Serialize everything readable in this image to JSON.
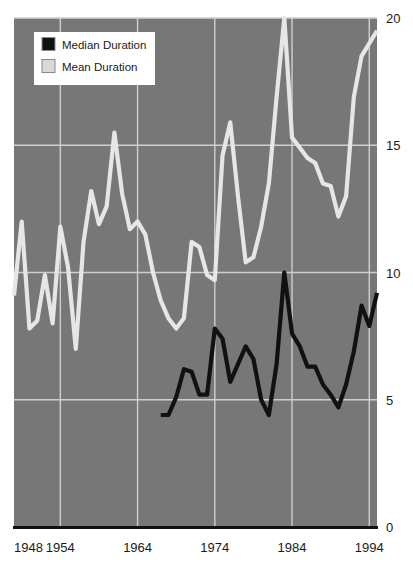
{
  "chart_data": {
    "type": "line",
    "title": "",
    "subtitle": "",
    "xlabel": "",
    "ylabel": "",
    "xlim": [
      1948,
      1995
    ],
    "ylim": [
      0,
      20
    ],
    "grid": true,
    "x_ticks": [
      "1948",
      "1954",
      "1964",
      "1974",
      "1984",
      "1994"
    ],
    "x_tick_values": [
      1948,
      1954,
      1964,
      1974,
      1984,
      1994
    ],
    "y_ticks": [
      "0",
      "5",
      "10",
      "15",
      "20"
    ],
    "y_tick_values": [
      0,
      5,
      10,
      15,
      20
    ],
    "legend": {
      "position": "top-left",
      "entries": [
        {
          "label": "Median Duration",
          "color": "#111111",
          "swatch": "black-square"
        },
        {
          "label": "Mean Duration",
          "color": "#d9d9d9",
          "swatch": "light-gray-square"
        }
      ]
    },
    "colors": {
      "plot_background": "#777777",
      "gridline": "#cfcfcf",
      "axis": "#111111",
      "mean_line": "#e6e6e6",
      "median_line": "#111111",
      "page_background": "#ffffff",
      "text": "#1a1a1a"
    },
    "series": [
      {
        "name": "Mean Duration",
        "color": "#e6e6e6",
        "x": [
          1948,
          1949,
          1950,
          1951,
          1952,
          1953,
          1954,
          1955,
          1956,
          1957,
          1958,
          1959,
          1960,
          1961,
          1962,
          1963,
          1964,
          1965,
          1966,
          1967,
          1968,
          1969,
          1970,
          1971,
          1972,
          1973,
          1974,
          1975,
          1976,
          1977,
          1978,
          1979,
          1980,
          1981,
          1982,
          1983,
          1984,
          1985,
          1986,
          1987,
          1988,
          1989,
          1990,
          1991,
          1992,
          1993,
          1994,
          1995
        ],
        "y": [
          9.1,
          12.0,
          7.8,
          8.1,
          9.9,
          8.0,
          11.8,
          10.2,
          7.0,
          11.2,
          13.2,
          11.9,
          12.6,
          15.5,
          13.1,
          11.7,
          12.0,
          11.5,
          10.0,
          8.9,
          8.2,
          7.8,
          8.2,
          11.2,
          11.0,
          9.9,
          9.7,
          14.6,
          15.9,
          13.0,
          10.4,
          10.6,
          11.8,
          13.5,
          16.9,
          20.0,
          15.3,
          14.9,
          14.5,
          14.3,
          13.5,
          13.4,
          12.2,
          13.0,
          16.9,
          18.5,
          19.0,
          19.5
        ]
      },
      {
        "name": "Median Duration",
        "color": "#111111",
        "x": [
          1967,
          1968,
          1969,
          1970,
          1971,
          1972,
          1973,
          1974,
          1975,
          1976,
          1977,
          1978,
          1979,
          1980,
          1981,
          1982,
          1983,
          1984,
          1985,
          1986,
          1987,
          1988,
          1989,
          1990,
          1991,
          1992,
          1993,
          1994,
          1995
        ],
        "y": [
          4.4,
          4.4,
          5.1,
          6.2,
          6.1,
          5.2,
          5.2,
          7.8,
          7.4,
          5.7,
          6.4,
          7.1,
          6.6,
          5.0,
          4.4,
          6.4,
          10.0,
          7.6,
          7.1,
          6.3,
          6.3,
          5.6,
          5.2,
          4.7,
          5.6,
          6.9,
          8.7,
          7.9,
          9.2
        ]
      }
    ],
    "annotations": []
  }
}
